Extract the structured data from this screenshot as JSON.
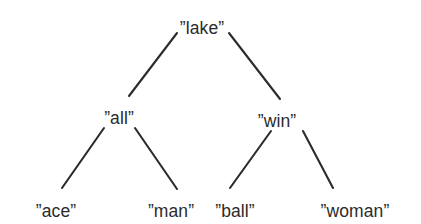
{
  "figure": {
    "type": "binary-tree-diagram",
    "background_color": "#ffffff",
    "line_color": "#2b2b2b",
    "text_color": "#2b2b2b",
    "quote_open": "”",
    "quote_close": "”"
  },
  "tree": {
    "root": {
      "id": "lake",
      "label": "”lake”",
      "text": "lake",
      "level": 0,
      "x": 202,
      "y": 20
    },
    "level1": [
      {
        "id": "all",
        "label": "”all”",
        "text": "all",
        "level": 1,
        "x": 119,
        "y": 110
      },
      {
        "id": "win",
        "label": "”win”",
        "text": "win",
        "level": 1,
        "x": 277,
        "y": 113
      }
    ],
    "level2": [
      {
        "id": "ace",
        "label": "”ace”",
        "text": "ace",
        "level": 2,
        "x": 56,
        "y": 203
      },
      {
        "id": "man",
        "label": "”man”",
        "text": "man",
        "level": 2,
        "x": 171,
        "y": 203
      },
      {
        "id": "ball",
        "label": "”ball”",
        "text": "ball",
        "level": 2,
        "x": 235,
        "y": 203
      },
      {
        "id": "woman",
        "label": "”woman”",
        "text": "woman",
        "level": 2,
        "x": 355,
        "y": 203
      }
    ],
    "edges": [
      {
        "id": "lake-all",
        "from": "lake",
        "to": "all",
        "x1": 177,
        "y1": 33,
        "x2": 129,
        "y2": 96
      },
      {
        "id": "lake-win",
        "from": "lake",
        "to": "win",
        "x1": 229,
        "y1": 33,
        "x2": 280,
        "y2": 99
      },
      {
        "id": "all-ace",
        "from": "all",
        "to": "ace",
        "x1": 104,
        "y1": 128,
        "x2": 62,
        "y2": 188
      },
      {
        "id": "all-man",
        "from": "all",
        "to": "man",
        "x1": 135,
        "y1": 128,
        "x2": 177,
        "y2": 189
      },
      {
        "id": "win-ball",
        "from": "win",
        "to": "ball",
        "x1": 271,
        "y1": 131,
        "x2": 230,
        "y2": 188
      },
      {
        "id": "win-woman",
        "from": "win",
        "to": "woman",
        "x1": 303,
        "y1": 131,
        "x2": 333,
        "y2": 188
      }
    ]
  }
}
